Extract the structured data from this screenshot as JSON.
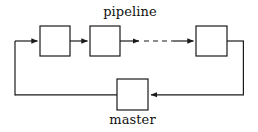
{
  "diagram": {
    "type": "block-flow-diagram",
    "canvas": {
      "width": 258,
      "height": 132,
      "background": "#ffffff"
    },
    "stroke_color": "#1a1a1a",
    "stroke_width": 1.2,
    "labels": {
      "pipeline": "pipeline",
      "master": "master"
    },
    "nodes": [
      {
        "id": "stage-1",
        "label": "",
        "x": 40,
        "y": 26,
        "width": 30,
        "height": 30
      },
      {
        "id": "stage-2",
        "label": "",
        "x": 90,
        "y": 26,
        "width": 30,
        "height": 30
      },
      {
        "id": "stage-n",
        "label": "",
        "x": 196,
        "y": 26,
        "width": 31,
        "height": 30
      },
      {
        "id": "master",
        "label": "",
        "x": 117,
        "y": 79,
        "width": 31,
        "height": 31
      }
    ],
    "edges": [
      {
        "id": "edge-feedback-to-stage-1",
        "style": "solid",
        "arrowhead": true,
        "from": "master-loop",
        "to": "stage-1"
      },
      {
        "id": "edge-stage-1-to-stage-2",
        "style": "solid",
        "arrowhead": true,
        "from": "stage-1",
        "to": "stage-2"
      },
      {
        "id": "edge-stage-2-to-ellipsis",
        "style": "solid",
        "arrowhead": true,
        "from": "stage-2",
        "to": "ellipsis"
      },
      {
        "id": "edge-ellipsis",
        "style": "dashed",
        "arrowhead": false,
        "from": "ellipsis",
        "to": "ellipsis"
      },
      {
        "id": "edge-ellipsis-to-stage-n",
        "style": "solid",
        "arrowhead": true,
        "from": "ellipsis",
        "to": "stage-n"
      },
      {
        "id": "edge-stage-n-to-master",
        "style": "solid",
        "arrowhead": true,
        "from": "stage-n",
        "to": "master"
      },
      {
        "id": "edge-master-to-feedback",
        "style": "solid",
        "arrowhead": false,
        "from": "master",
        "to": "master-loop"
      }
    ]
  }
}
